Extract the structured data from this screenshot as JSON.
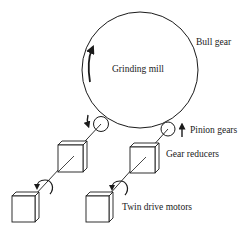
{
  "diagram": {
    "colors": {
      "line": "#1a1a1a",
      "background": "#ffffff"
    },
    "labels": {
      "bull_gear": "Bull gear",
      "grinding_mill": "Grinding mill",
      "pinion_gears": "Pinion gears",
      "gear_reducers": "Gear reducers",
      "twin_drive_motors": "Twin drive motors"
    },
    "components": [
      {
        "id": "bull-gear",
        "type": "circle",
        "label_ref": "bull_gear"
      },
      {
        "id": "pinion-left",
        "type": "circle",
        "label_ref": "pinion_gears"
      },
      {
        "id": "pinion-right",
        "type": "circle",
        "label_ref": "pinion_gears"
      },
      {
        "id": "reducer-left",
        "type": "box",
        "label_ref": "gear_reducers"
      },
      {
        "id": "reducer-right",
        "type": "box",
        "label_ref": "gear_reducers"
      },
      {
        "id": "motor-left",
        "type": "box",
        "label_ref": "twin_drive_motors"
      },
      {
        "id": "motor-right",
        "type": "box",
        "label_ref": "twin_drive_motors"
      }
    ],
    "connections": [
      {
        "from": "motor-left",
        "to": "reducer-left",
        "type": "shaft"
      },
      {
        "from": "reducer-left",
        "to": "pinion-left",
        "type": "shaft"
      },
      {
        "from": "motor-right",
        "to": "reducer-right",
        "type": "shaft"
      },
      {
        "from": "reducer-right",
        "to": "pinion-right",
        "type": "shaft"
      },
      {
        "from": "pinion-left",
        "to": "bull-gear",
        "type": "mesh"
      },
      {
        "from": "pinion-right",
        "to": "bull-gear",
        "type": "mesh"
      }
    ]
  }
}
